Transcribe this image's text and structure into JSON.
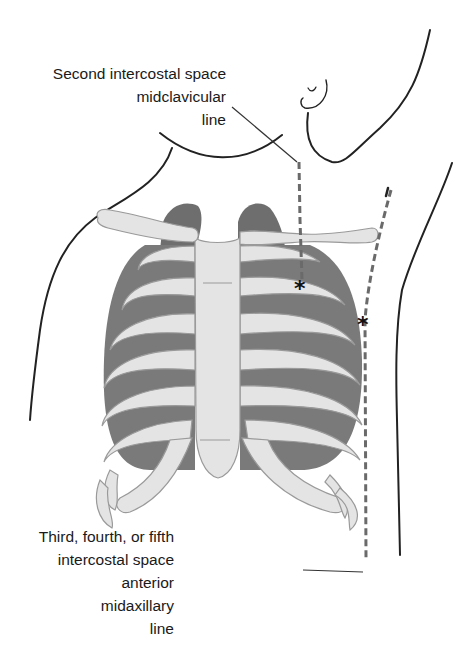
{
  "figure": {
    "colors": {
      "bone": "#e4e4e4",
      "bone_outline": "#9a9a9a",
      "lung_dark": "#6e6e6e",
      "lung_mid": "#8a8a8a",
      "body_outline": "#222222",
      "dashed_line": "#6a6a6a",
      "marker": "#111111",
      "text": "#1a1a1a",
      "background": "#ffffff"
    },
    "markers": [
      {
        "symbol": "*",
        "name": "midclavicular-marker"
      },
      {
        "symbol": "*",
        "name": "midaxillary-marker"
      }
    ]
  },
  "labels": {
    "top": {
      "lines": [
        "Second intercostal space",
        "midclavicular",
        "line"
      ]
    },
    "bottom": {
      "lines": [
        "Third, fourth, or fifth",
        "intercostal space",
        "anterior",
        "midaxillary",
        "line"
      ]
    }
  }
}
